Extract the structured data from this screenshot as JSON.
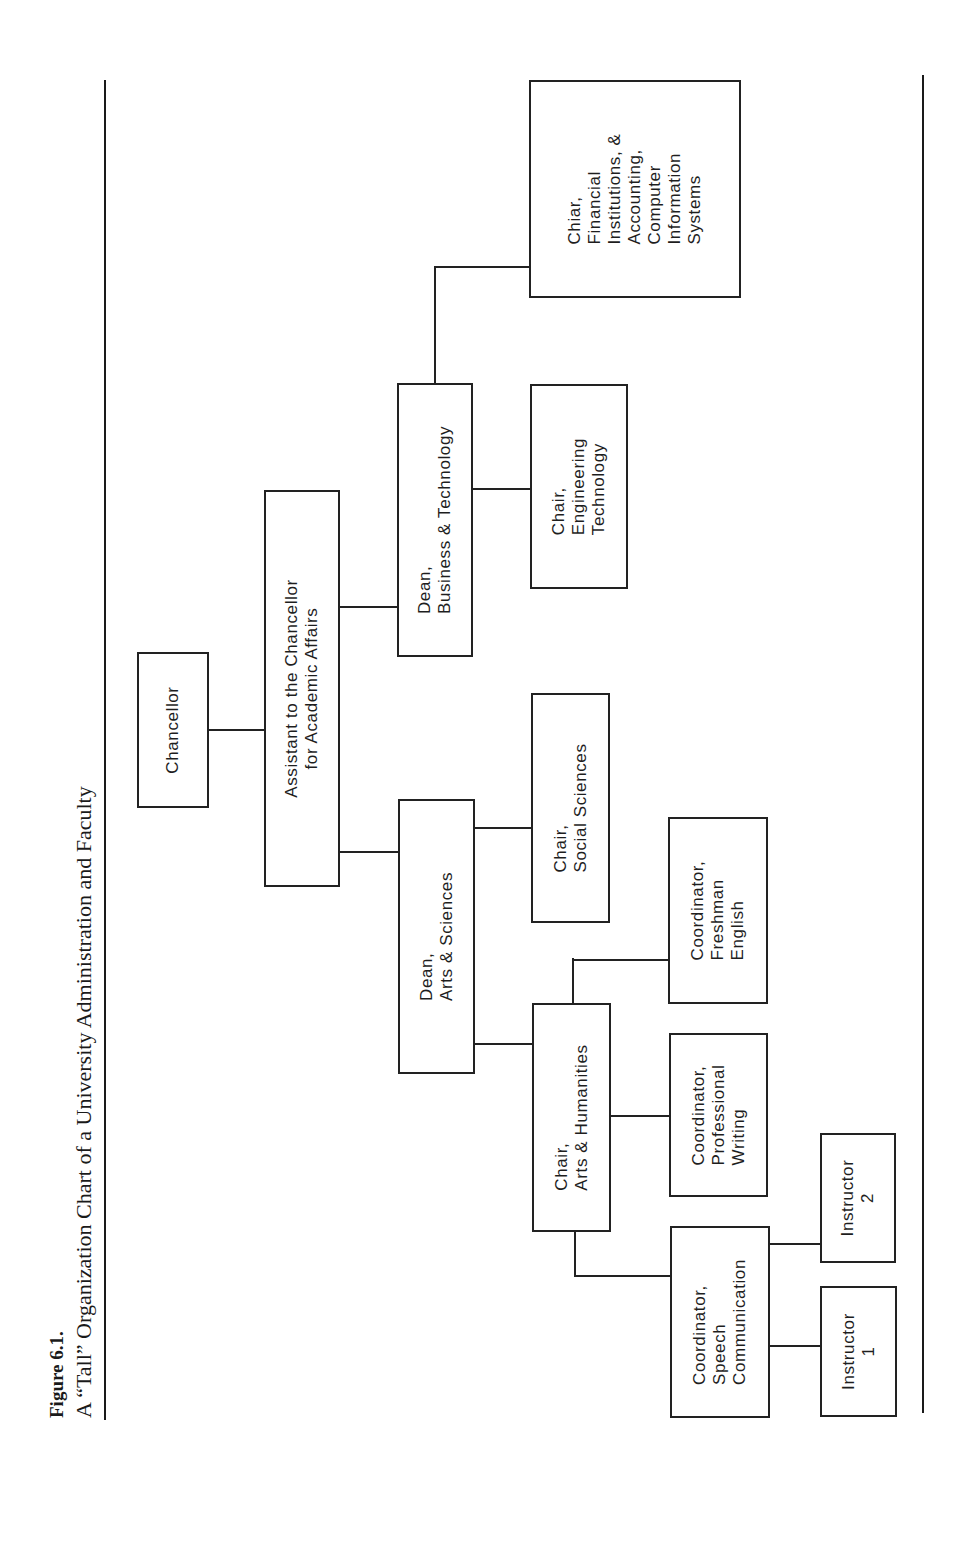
{
  "caption": {
    "figure_label": "Figure 6.1.",
    "title": "A “Tall” Organization Chart of a University Administration and Faculty"
  },
  "org_chart": {
    "nodes": [
      {
        "id": "chancellor",
        "label": "Chancellor"
      },
      {
        "id": "assistant",
        "label": "Assistant to the Chancellor\nfor Academic Affairs"
      },
      {
        "id": "dean-business",
        "label": "Dean,\nBusiness & Technology"
      },
      {
        "id": "chair-engineering",
        "label": "Chair,\nEngineering\nTechnology"
      },
      {
        "id": "chair-financial",
        "label": "Chiar,\nFinancial\nInstitutions, &\nAccounting,\nComputer\nInformation\nSystems"
      },
      {
        "id": "dean-arts",
        "label": "Dean,\nArts & Sciences"
      },
      {
        "id": "chair-social",
        "label": "Chair,\nSocial Sciences"
      },
      {
        "id": "chair-humanities",
        "label": "Chair,\nArts & Humanities"
      },
      {
        "id": "coord-professional",
        "label": "Coordinator,\nProfessional\nWriting"
      },
      {
        "id": "coord-freshman",
        "label": "Coordinator,\nFreshman\nEnglish"
      },
      {
        "id": "coord-speech",
        "label": "Coordinator,\nSpeech\nCommunication"
      },
      {
        "id": "instructor-2",
        "label": "Instructor\n2"
      },
      {
        "id": "instructor-1",
        "label": "Instructor\n1"
      }
    ],
    "edges": [
      [
        "chancellor",
        "assistant"
      ],
      [
        "assistant",
        "dean-business"
      ],
      [
        "assistant",
        "dean-arts"
      ],
      [
        "dean-business",
        "chair-engineering"
      ],
      [
        "dean-business",
        "chair-financial"
      ],
      [
        "dean-arts",
        "chair-social"
      ],
      [
        "dean-arts",
        "chair-humanities"
      ],
      [
        "chair-humanities",
        "coord-professional"
      ],
      [
        "chair-humanities",
        "coord-freshman"
      ],
      [
        "chair-humanities",
        "coord-speech"
      ],
      [
        "coord-speech",
        "instructor-2"
      ],
      [
        "coord-speech",
        "instructor-1"
      ]
    ]
  },
  "labels": {
    "chancellor": "Chancellor",
    "assistant": "Assistant to the Chancellor\nfor Academic Affairs",
    "dean_business": "Dean,\nBusiness & Technology",
    "chair_engineering": "Chair,\nEngineering\nTechnology",
    "chair_financial": "Chiar,\nFinancial\nInstitutions, &\nAccounting,\nComputer\nInformation\nSystems",
    "dean_arts": "Dean,\nArts & Sciences",
    "chair_social": "Chair,\nSocial Sciences",
    "chair_humanities": "Chair,\nArts & Humanities",
    "coord_professional": "Coordinator,\nProfessional\nWriting",
    "coord_freshman": "Coordinator,\nFreshman\nEnglish",
    "coord_speech": "Coordinator,\nSpeech\nCommunication",
    "instructor_2": "Instructor\n2",
    "instructor_1": "Instructor\n1"
  }
}
